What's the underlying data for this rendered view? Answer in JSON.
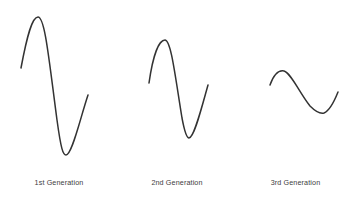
{
  "figure": {
    "background_color": "#ffffff",
    "stroke_color": "#333333",
    "caption_color": "#3d3d3d"
  },
  "captions": [
    {
      "label": "1st Generation"
    },
    {
      "label": "2nd Generation"
    },
    {
      "label": "3rd Generation"
    }
  ],
  "chart_data": {
    "type": "line",
    "title": "",
    "xlabel": "",
    "ylabel": "",
    "grid": false,
    "legend": false,
    "note": "Three separate damped sine-like curves, amplitude decreasing from 1st to 3rd generation. Coordinates are in screenshot pixel space with y increasing downward.",
    "series": [
      {
        "name": "1st Generation",
        "amplitude_rank": 1,
        "path": "M21,68 C27,36 32,17 38,17 C45,17 49,60 57,120 C61,149 63,155 66,155 C72,155 80,119 88,95",
        "points": {
          "start": [
            21,
            68
          ],
          "peak": [
            38,
            17
          ],
          "trough": [
            64,
            155
          ],
          "end": [
            88,
            95
          ]
        }
      },
      {
        "name": "2nd Generation",
        "amplitude_rank": 2,
        "path": "M149,83 C153,55 159,40 165,40 C171,40 175,75 182,118 C185,134 187,138 189,138 C194,138 201,110 208,85",
        "points": {
          "start": [
            149,
            83
          ],
          "peak": [
            165,
            40
          ],
          "trough": [
            189,
            138
          ],
          "end": [
            208,
            85
          ]
        }
      },
      {
        "name": "3rd Generation",
        "amplitude_rank": 3,
        "path": "M270,85 C274,74 279,70 284,71 C291,73 299,92 310,106 C316,112 320,114 324,113 C329,111 334,102 338,92",
        "points": {
          "start": [
            270,
            85
          ],
          "peak": [
            284,
            70
          ],
          "trough": [
            324,
            113
          ],
          "end": [
            338,
            92
          ]
        }
      }
    ]
  }
}
